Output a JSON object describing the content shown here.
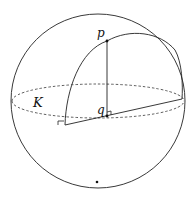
{
  "diagram": {
    "labels": {
      "p": "p",
      "q": "q",
      "K": "K"
    },
    "colors": {
      "stroke": "#222222",
      "background": "#ffffff"
    }
  }
}
